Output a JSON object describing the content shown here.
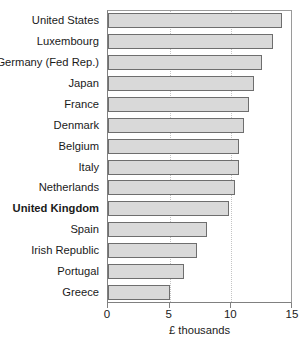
{
  "chart_data": {
    "type": "bar",
    "orientation": "horizontal",
    "title": "",
    "xlabel": "£ thousands",
    "ylabel": "",
    "xlim": [
      0,
      15
    ],
    "xticks": [
      0,
      5,
      10,
      15
    ],
    "xtick_labels": [
      "0",
      "5",
      "10",
      "15"
    ],
    "grid": "vertical-dotted-at-5-and-10",
    "legend": "none",
    "highlight_category": "United Kingdom",
    "categories": [
      "United States",
      "Luxembourg",
      "Germany (Fed Rep.)",
      "Japan",
      "France",
      "Denmark",
      "Belgium",
      "Italy",
      "Netherlands",
      "United Kingdom",
      "Spain",
      "Irish Republic",
      "Portugal",
      "Greece"
    ],
    "values": [
      14.1,
      13.4,
      12.5,
      11.8,
      11.4,
      11.0,
      10.6,
      10.6,
      10.3,
      9.8,
      8.0,
      7.2,
      6.2,
      5.0
    ]
  },
  "colors": {
    "bar_fill": "#d9d9d9",
    "bar_border": "#6e6e6e",
    "frame": "#808080",
    "gridline": "#c4c4c4",
    "text": "#1a1a1a",
    "background": "#ffffff"
  }
}
